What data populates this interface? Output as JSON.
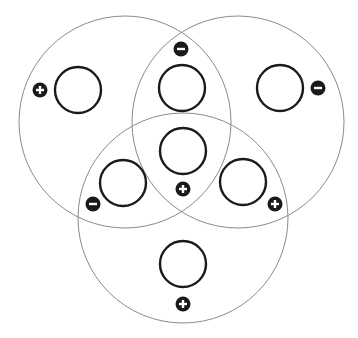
{
  "diagram": {
    "type": "three-set-venn",
    "background": "#ffffff",
    "colors": {
      "set_outline": "#8a8a8a",
      "slot_outline": "#1a1a1a",
      "badge_fill": "#1a1a1a",
      "badge_glyph": "#ffffff"
    },
    "sets": [
      {
        "id": "A",
        "position": "top-left",
        "cx": 125,
        "cy": 122,
        "r": 106
      },
      {
        "id": "B",
        "position": "top-right",
        "cx": 238,
        "cy": 122,
        "r": 106
      },
      {
        "id": "C",
        "position": "bottom",
        "cx": 183,
        "cy": 218,
        "r": 105
      }
    ],
    "regions": [
      {
        "id": "A-only",
        "slot": {
          "cx": 78,
          "cy": 90,
          "r": 23
        },
        "badge": {
          "cx": 40,
          "cy": 90,
          "sign": "+"
        }
      },
      {
        "id": "B-only",
        "slot": {
          "cx": 280,
          "cy": 88,
          "r": 23
        },
        "badge": {
          "cx": 318,
          "cy": 88,
          "sign": "−"
        }
      },
      {
        "id": "A∩B",
        "slot": {
          "cx": 182,
          "cy": 88,
          "r": 23
        },
        "badge": {
          "cx": 181,
          "cy": 49,
          "sign": "−"
        }
      },
      {
        "id": "A∩B∩C",
        "slot": {
          "cx": 183,
          "cy": 151,
          "r": 23
        },
        "badge": {
          "cx": 183,
          "cy": 189,
          "sign": "+"
        }
      },
      {
        "id": "A∩C",
        "slot": {
          "cx": 123,
          "cy": 183,
          "r": 23
        },
        "badge": {
          "cx": 93,
          "cy": 204,
          "sign": "−"
        }
      },
      {
        "id": "B∩C",
        "slot": {
          "cx": 243,
          "cy": 182,
          "r": 23
        },
        "badge": {
          "cx": 275,
          "cy": 204,
          "sign": "+"
        }
      },
      {
        "id": "C-only",
        "slot": {
          "cx": 183,
          "cy": 264,
          "r": 23
        },
        "badge": {
          "cx": 183,
          "cy": 304,
          "sign": "+"
        }
      }
    ]
  }
}
